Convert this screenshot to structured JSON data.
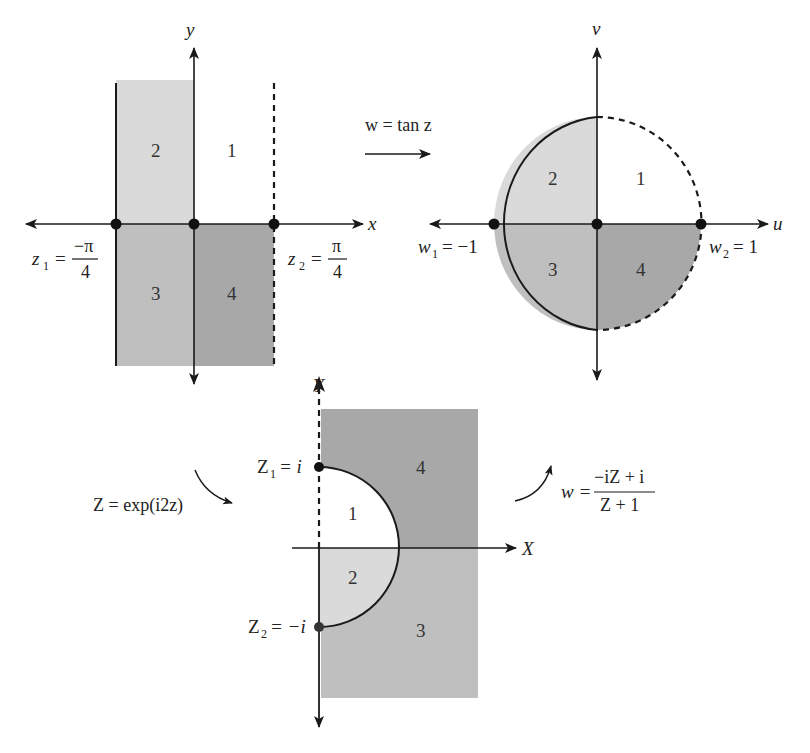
{
  "colors": {
    "region1": "#ffffff",
    "region2": "#dadada",
    "region3": "#bfbfbf",
    "region4": "#a8a8a8",
    "line": "#1a1a1a"
  },
  "z_plane": {
    "x_axis_label": "x",
    "y_axis_label": "y",
    "regions": [
      "1",
      "2",
      "3",
      "4"
    ],
    "point1": {
      "lhs": "z",
      "sub": "1",
      "eq": "=",
      "num": "−π",
      "den": "4"
    },
    "point2": {
      "lhs": "z",
      "sub": "2",
      "eq": "=",
      "num": "π",
      "den": "4"
    }
  },
  "w_plane": {
    "u_axis_label": "u",
    "v_axis_label": "v",
    "regions": [
      "1",
      "2",
      "3",
      "4"
    ],
    "point1": {
      "lhs": "w",
      "sub": "1",
      "rhs": "= −1"
    },
    "point2": {
      "lhs": "w",
      "sub": "2",
      "rhs": "= 1"
    }
  },
  "Z_plane": {
    "X_axis_label": "X",
    "Y_axis_label": "Y",
    "regions": [
      "1",
      "2",
      "3",
      "4"
    ],
    "point1": {
      "lhs": "Z",
      "sub": "1",
      "rhs": "= i"
    },
    "point2": {
      "lhs": "Z",
      "sub": "2",
      "rhs": "= −i"
    }
  },
  "mappings": {
    "tan": {
      "label": "w = tan z"
    },
    "exp": {
      "label": "Z = exp(i2z)"
    },
    "mobius": {
      "lhs": "w =",
      "num": "−iZ + i",
      "den": "Z + 1"
    }
  }
}
